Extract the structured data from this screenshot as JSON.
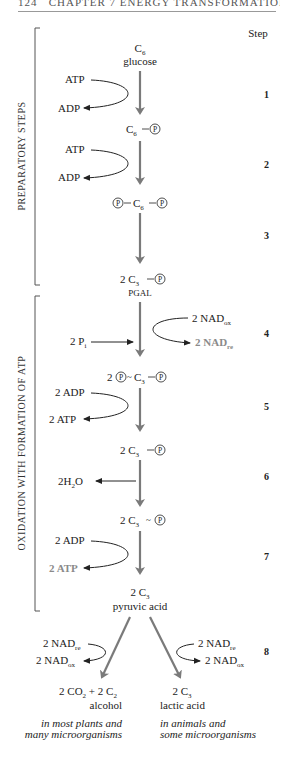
{
  "header": {
    "page_number": "124",
    "chapter": "CHAPTER 7  ENERGY TRANSFORMATIONS"
  },
  "step_column_label": "Step",
  "brackets": {
    "preparatory": "PREPARATORY STEPS",
    "oxidation": "OXIDATION WITH FORMATION OF ATP"
  },
  "colors": {
    "main_arrow": "#7a7a7a",
    "highlight_text": "#8a8a8a",
    "text": "#222222"
  },
  "steps": [
    {
      "number": "1",
      "inputs": [
        "ATP"
      ],
      "outputs": [
        "ADP"
      ]
    },
    {
      "number": "2",
      "inputs": [
        "ATP"
      ],
      "outputs": [
        "ADP"
      ]
    },
    {
      "number": "3",
      "inputs": [],
      "outputs": []
    },
    {
      "number": "4",
      "inputs": [
        "2 Pi",
        "2 NADox"
      ],
      "outputs": [
        "2 NADre"
      ]
    },
    {
      "number": "5",
      "inputs": [
        "2 ADP"
      ],
      "outputs": [
        "2 ATP"
      ]
    },
    {
      "number": "6",
      "inputs": [],
      "outputs": [
        "2H2O"
      ]
    },
    {
      "number": "7",
      "inputs": [
        "2 ADP"
      ],
      "outputs": [
        "2 ATP"
      ]
    },
    {
      "number": "8",
      "inputs": [
        "2 NADre"
      ],
      "outputs": [
        "2 NADox"
      ]
    }
  ],
  "compounds": {
    "glucose": {
      "formula": "C6",
      "name": "glucose"
    },
    "c6p": {
      "formula": "C6—P"
    },
    "pc6p": {
      "formula": "P—C6—P"
    },
    "pgal": {
      "formula": "2 C3—P",
      "name": "PGAL"
    },
    "pc3p": {
      "formula": "2 P~C3—P"
    },
    "c3p": {
      "formula": "2 C3—P"
    },
    "c3hp": {
      "formula": "2 C3~P"
    },
    "pyruvic": {
      "formula": "2 C3",
      "name": "pyruvic acid"
    },
    "alcohol": {
      "formula": "2 CO2 + 2 C2",
      "name": "alcohol",
      "note_line1": "in most plants and",
      "note_line2": "many microorganisms"
    },
    "lactic": {
      "formula": "2 C3",
      "name": "lactic acid",
      "note_line1": "in animals and",
      "note_line2": "some microorganisms"
    }
  },
  "labels": {
    "atp": "ATP",
    "adp": "ADP",
    "two_adp": "2 ADP",
    "two_atp": "2 ATP",
    "two_p": "2 P",
    "i": "i",
    "two_nad": "2 NAD",
    "ox": "ox",
    "re": "re",
    "h2o_pre": "2H",
    "h2o_sub": "2",
    "h2o_post": "O",
    "p": "P",
    "c": "C",
    "six": "6",
    "three": "3",
    "two": "2",
    "two_space": "2 ",
    "co2": "2 CO",
    "plus_c": " + 2 C"
  }
}
